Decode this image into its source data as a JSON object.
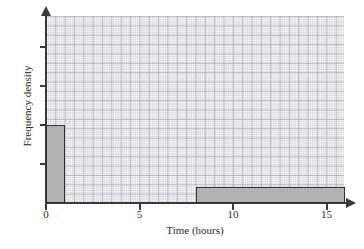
{
  "chart_data": {
    "type": "bar",
    "title": "",
    "xlabel": "Time (hours)",
    "ylabel": "Frequency density",
    "xlim": [
      0,
      16.5
    ],
    "ylim": [
      0,
      4.8
    ],
    "grid": true,
    "legend": "none",
    "x_ticks": [
      {
        "value": 0,
        "label": "0"
      },
      {
        "value": 5,
        "label": "5"
      },
      {
        "value": 10,
        "label": "10"
      },
      {
        "value": 15,
        "label": "15"
      }
    ],
    "y_ticks": [
      {
        "value": 1,
        "label": ""
      },
      {
        "value": 2,
        "label": ""
      },
      {
        "value": 3,
        "label": ""
      },
      {
        "value": 4,
        "label": ""
      }
    ],
    "bars": [
      {
        "label": "0-1",
        "x_start": 0,
        "x_end": 1,
        "frequency_density": 2
      },
      {
        "label": "8-16",
        "x_start": 8,
        "x_end": 16,
        "frequency_density": 0.4
      }
    ],
    "bar_fill_color": "#b2b2b2",
    "bar_edge_color": "#303030",
    "grid_color": "#c8c8ce",
    "axis_color": "#3a3a3a"
  }
}
